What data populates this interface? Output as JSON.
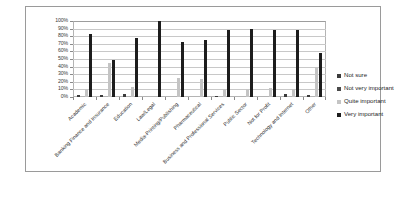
{
  "chart_data": {
    "type": "bar",
    "title": "",
    "xlabel": "",
    "ylabel": "",
    "ylim": [
      0,
      100
    ],
    "ytick_labels": [
      "100%",
      "90%",
      "80%",
      "70%",
      "60%",
      "50%",
      "40%",
      "30%",
      "20%",
      "10%",
      "0%"
    ],
    "ytick_values": [
      100,
      90,
      80,
      70,
      60,
      50,
      40,
      30,
      20,
      10,
      0
    ],
    "grid": true,
    "legend_position": "right",
    "categories": [
      "Academic",
      "Banking Finance and Insurance",
      "Education",
      "Law/Legal",
      "Media-Printing/Publishing",
      "Pharmaceutical",
      "Business and Professional Services",
      "Public Sector",
      "Not for Profit",
      "Technology and Internet",
      "Other"
    ],
    "series": [
      {
        "name": "Not sure",
        "color": "#3b3b3b",
        "values": [
          2,
          3,
          4,
          0,
          0,
          0,
          1,
          0,
          0,
          4,
          3
        ]
      },
      {
        "name": "Not very important",
        "color": "#4a4a4a",
        "values": [
          0,
          0,
          0,
          0,
          0,
          0,
          0,
          0,
          0,
          0,
          0
        ]
      },
      {
        "name": "Quite important",
        "color": "#c4c4c4",
        "values": [
          11,
          45,
          13,
          0,
          25,
          24,
          10,
          11,
          12,
          10,
          40
        ]
      },
      {
        "name": "Very important",
        "color": "#1d1d1d",
        "values": [
          83,
          49,
          78,
          100,
          73,
          75,
          88,
          89,
          88,
          88,
          58
        ]
      }
    ]
  },
  "legend": {
    "items": [
      {
        "label": "Not sure"
      },
      {
        "label": "Not very important"
      },
      {
        "label": "Quite important"
      },
      {
        "label": "Very important"
      }
    ]
  }
}
